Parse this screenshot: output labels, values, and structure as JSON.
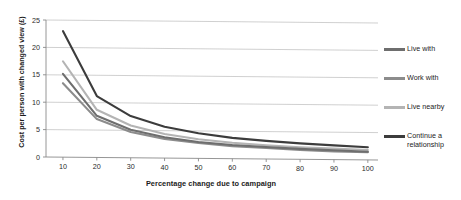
{
  "chart_data": {
    "type": "line",
    "title": "",
    "xlabel": "Percentage change due to campaign",
    "ylabel": "Cost per person with changed view (£)",
    "x": [
      10,
      20,
      30,
      40,
      50,
      60,
      70,
      80,
      90,
      100
    ],
    "xlim": [
      5,
      103
    ],
    "ylim": [
      0,
      25
    ],
    "xticks": [
      "10",
      "20",
      "30",
      "40",
      "50",
      "60",
      "70",
      "80",
      "90",
      "100"
    ],
    "yticks": [
      "0",
      "5",
      "10",
      "15",
      "20",
      "25"
    ],
    "grid": "horizontal",
    "legend_position": "right",
    "series": [
      {
        "name": "Live with",
        "color": "#6e6e6e",
        "values": [
          15.2,
          7.6,
          5.1,
          3.8,
          3.0,
          2.5,
          2.2,
          1.9,
          1.7,
          1.5
        ]
      },
      {
        "name": "Work with",
        "color": "#8c8c8c",
        "values": [
          13.5,
          7.0,
          4.7,
          3.5,
          2.8,
          2.3,
          2.0,
          1.7,
          1.5,
          1.4
        ]
      },
      {
        "name": "Live nearby",
        "color": "#b4b4b4",
        "values": [
          17.5,
          8.7,
          5.9,
          4.4,
          3.5,
          2.9,
          2.5,
          2.2,
          2.0,
          1.8
        ]
      },
      {
        "name": "Continue a relationship",
        "color": "#3c3c3c",
        "values": [
          23.0,
          11.2,
          7.6,
          5.7,
          4.6,
          3.8,
          3.3,
          2.9,
          2.6,
          2.3
        ]
      }
    ]
  },
  "axis": {
    "x_title": "Percentage change due to campaign",
    "y_title": "Cost per person with changed view (£)"
  },
  "legend": {
    "entries": [
      {
        "label": "Live with",
        "color": "#6e6e6e"
      },
      {
        "label": "Work with",
        "color": "#8c8c8c"
      },
      {
        "label": "Live nearby",
        "color": "#b4b4b4"
      },
      {
        "label": "Continue a relationship",
        "color": "#3c3c3c"
      }
    ]
  },
  "colors": {
    "axis": "#8a8a8a",
    "grid": "#c4c4c4",
    "text": "#1c1c1c",
    "background": "#ffffff"
  }
}
